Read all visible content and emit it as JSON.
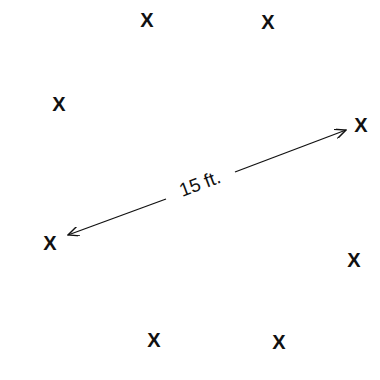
{
  "diagram": {
    "type": "spacing-diagram",
    "marker_symbol": "X",
    "markers": [
      {
        "id": "top-left",
        "x": 147,
        "y": 20
      },
      {
        "id": "top-right",
        "x": 268,
        "y": 22
      },
      {
        "id": "upper-left",
        "x": 59,
        "y": 104
      },
      {
        "id": "right",
        "x": 361,
        "y": 125
      },
      {
        "id": "left",
        "x": 50,
        "y": 243
      },
      {
        "id": "lower-right",
        "x": 354,
        "y": 260
      },
      {
        "id": "bottom-left",
        "x": 154,
        "y": 340
      },
      {
        "id": "bottom-right",
        "x": 279,
        "y": 342
      }
    ],
    "dimension": {
      "label": "15 ft.",
      "from": {
        "x": 68,
        "y": 235
      },
      "to": {
        "x": 346,
        "y": 130
      },
      "gap_start": {
        "x": 166,
        "y": 199
      },
      "gap_end": {
        "x": 235,
        "y": 172
      },
      "label_position": {
        "x": 200,
        "y": 190
      },
      "angle_deg": -20.7
    },
    "colors": {
      "ink": "#111111",
      "background": "#ffffff"
    }
  }
}
